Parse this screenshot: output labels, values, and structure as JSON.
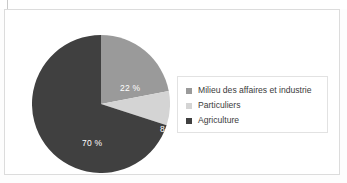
{
  "figure": {
    "background_color": "#ffffff",
    "frame_color": "#dcdcdc"
  },
  "chart_data": {
    "type": "pie",
    "title": "",
    "subtitle": "",
    "xlabel": "",
    "ylabel": "",
    "grid": false,
    "legend_position": "right",
    "units": "percent",
    "start_angle_deg": 0,
    "direction": "clockwise",
    "categories": [
      "Milieu des affaires et industrie",
      "Particuliers",
      "Agriculture"
    ],
    "values": [
      22,
      8,
      70
    ],
    "data_labels": [
      "22 %",
      "8 %",
      "70 %"
    ],
    "colors": [
      "#9a9a9a",
      "#d4d4d4",
      "#404040"
    ],
    "slices": [
      {
        "label": "Milieu des affaires et industrie",
        "value": 22,
        "data_label": "22 %",
        "color": "#9a9a9a",
        "start_angle_deg": 0,
        "end_angle_deg": 79.2
      },
      {
        "label": "Particuliers",
        "value": 8,
        "data_label": "8 %",
        "color": "#d4d4d4",
        "start_angle_deg": 79.2,
        "end_angle_deg": 108.0
      },
      {
        "label": "Agriculture",
        "value": 70,
        "data_label": "70 %",
        "color": "#404040",
        "start_angle_deg": 108.0,
        "end_angle_deg": 360.0
      }
    ]
  },
  "legend": {
    "items": [
      {
        "label": "Milieu des affaires et industrie",
        "color": "#9a9a9a"
      },
      {
        "label": "Particuliers",
        "color": "#d4d4d4"
      },
      {
        "label": "Agriculture",
        "color": "#404040"
      }
    ]
  }
}
